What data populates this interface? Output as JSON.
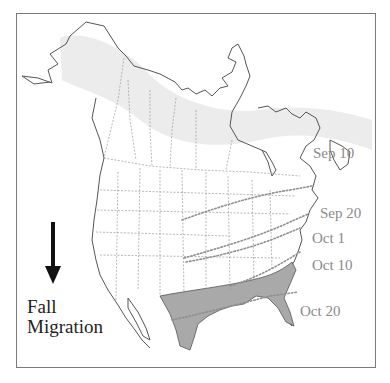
{
  "map": {
    "title_line1": "Fall",
    "title_line2": "Migration",
    "direction_icon": "arrow-down-icon",
    "isochrones": [
      {
        "label": "Sep 10",
        "x": 313,
        "y": 146
      },
      {
        "label": "Sep 20",
        "x": 320,
        "y": 206
      },
      {
        "label": "Oct 1",
        "x": 312,
        "y": 231
      },
      {
        "label": "Oct 10",
        "x": 312,
        "y": 258
      },
      {
        "label": "Oct 20",
        "x": 300,
        "y": 304
      }
    ],
    "colors": {
      "breeding_range": "#ececec",
      "wintering_range": "#a9a9a9",
      "outline": "#555555",
      "borders": "#9a9a9a",
      "isochrone": "#8f8f8f",
      "label": "#8a8a8a"
    }
  }
}
